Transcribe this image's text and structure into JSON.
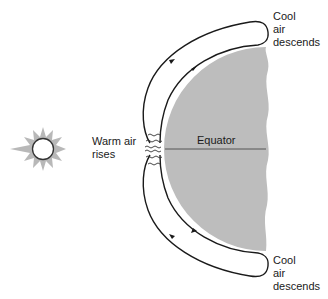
{
  "figure": {
    "labels": {
      "cool_air_top": [
        "Cool",
        "air",
        "descends"
      ],
      "cool_air_bottom": [
        "Cool",
        "air",
        "descends"
      ],
      "warm_air": [
        "Warm air",
        "rises"
      ],
      "equator": "Equator"
    },
    "colors": {
      "earth_fill": "#bdbdbd",
      "sun_rays": "#b0b0b0",
      "line": "#1a1a1a",
      "background": "#ffffff"
    }
  }
}
